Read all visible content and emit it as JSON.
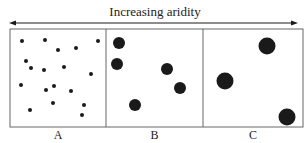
{
  "title": "Increasing aridity",
  "colors": {
    "ink": "#1a1a1a",
    "frame": "#666666"
  },
  "panels": [
    {
      "label": "A",
      "x0": 10,
      "x1": 106,
      "dot_radius": 2,
      "dots": [
        [
          22,
          41
        ],
        [
          45,
          40
        ],
        [
          58,
          50
        ],
        [
          76,
          48
        ],
        [
          98,
          41
        ],
        [
          26,
          61
        ],
        [
          31,
          68
        ],
        [
          44,
          70
        ],
        [
          64,
          67
        ],
        [
          91,
          74
        ],
        [
          21,
          85
        ],
        [
          46,
          90
        ],
        [
          54,
          86
        ],
        [
          71,
          91
        ],
        [
          53,
          103
        ],
        [
          84,
          105
        ],
        [
          30,
          110
        ],
        [
          82,
          115
        ]
      ]
    },
    {
      "label": "B",
      "x0": 106,
      "x1": 203,
      "dot_radius": 6,
      "dots": [
        [
          119,
          43
        ],
        [
          117,
          64
        ],
        [
          167,
          69
        ],
        [
          180,
          88
        ],
        [
          135,
          105
        ]
      ]
    },
    {
      "label": "C",
      "x0": 203,
      "x1": 303,
      "dot_radius": 8.5,
      "dots": [
        [
          267,
          46
        ],
        [
          225,
          81
        ],
        [
          287,
          117
        ]
      ]
    }
  ]
}
